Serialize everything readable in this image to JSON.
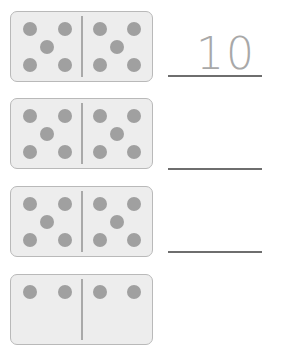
{
  "worksheet": {
    "dot_color": "#a0a0a0",
    "rows": [
      {
        "left_pips": 5,
        "right_pips": 5,
        "answer": "10"
      },
      {
        "left_pips": 5,
        "right_pips": 5,
        "answer": ""
      },
      {
        "left_pips": 5,
        "right_pips": 5,
        "answer": ""
      },
      {
        "left_pips": 4,
        "right_pips": 4,
        "answer": ""
      }
    ]
  }
}
